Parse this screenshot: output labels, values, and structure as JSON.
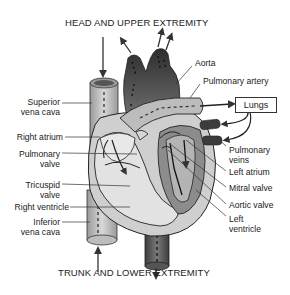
{
  "diagram": {
    "top_title": "HEAD AND UPPER EXTREMITY",
    "bottom_title": "TRUNK AND LOWER EXTREMITY",
    "lungs_box": "Lungs",
    "left_labels": [
      {
        "line1": "Superior",
        "line2": "vena cava"
      },
      {
        "line1": "Right atrium",
        "line2": ""
      },
      {
        "line1": "Pulmonary",
        "line2": "valve"
      },
      {
        "line1": "Tricuspid",
        "line2": "valve"
      },
      {
        "line1": "Right ventricle",
        "line2": ""
      },
      {
        "line1": "Inferior",
        "line2": "vena cava"
      }
    ],
    "right_labels": [
      {
        "line1": "Aorta",
        "line2": ""
      },
      {
        "line1": "Pulmonary artery",
        "line2": ""
      },
      {
        "line1": "Pulmonary",
        "line2": "veins"
      },
      {
        "line1": "Left atrium",
        "line2": ""
      },
      {
        "line1": "Mitral valve",
        "line2": ""
      },
      {
        "line1": "Aortic valve",
        "line2": ""
      },
      {
        "line1": "Left",
        "line2": "ventricle"
      }
    ],
    "colors": {
      "dark_vessel": "#4a4a4a",
      "mid_gray": "#8c8c8c",
      "light_gray": "#cfcfcf",
      "chamber_fill": "#e2e2e2",
      "outline": "#222222"
    }
  }
}
